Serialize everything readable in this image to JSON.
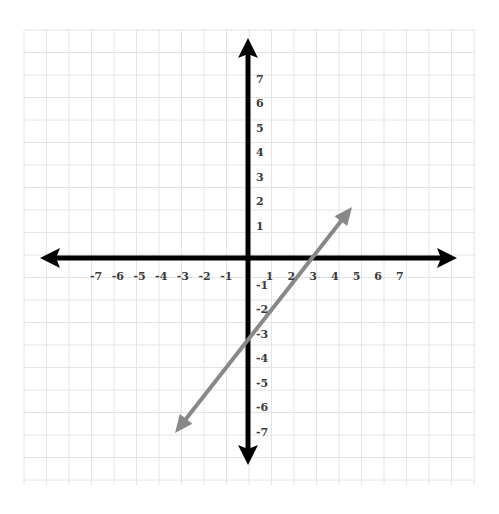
{
  "chart_data": {
    "type": "line",
    "title": "",
    "xlabel": "",
    "ylabel": "",
    "xlim": [
      -7,
      7
    ],
    "ylim": [
      -7,
      7
    ],
    "grid": true,
    "x_ticks": [
      "-7",
      "-6",
      "-5",
      "-4",
      "-3",
      "-2",
      "-1",
      "1",
      "2",
      "3",
      "4",
      "5",
      "6",
      "7"
    ],
    "y_ticks": [
      "7",
      "6",
      "5",
      "4",
      "3",
      "2",
      "1",
      "-1",
      "-2",
      "-3",
      "-4",
      "-5",
      "-6",
      "-7"
    ],
    "series": [
      {
        "name": "line",
        "equation": "y = x - 3",
        "slope": 1,
        "y_intercept": -3,
        "x_intercept": 3,
        "x": [
          -3.3,
          5
        ],
        "y": [
          -6.9,
          2.1
        ],
        "color": "#888888",
        "arrows": "both"
      }
    ],
    "axes": {
      "color": "#000000",
      "arrows": "both-ends"
    }
  },
  "colors": {
    "grid": "#e4e4e4",
    "axis": "#000000",
    "line": "#888888",
    "tick_label": "#3a3a3a"
  }
}
